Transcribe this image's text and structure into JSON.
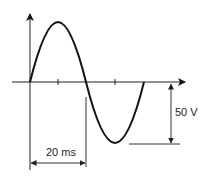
{
  "diagram": {
    "type": "sine-wave",
    "amplitude_label": "50 V",
    "period_label": "20 ms",
    "colors": {
      "stroke": "#111111",
      "dim": "#333333"
    }
  }
}
